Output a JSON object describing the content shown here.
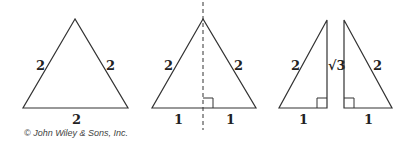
{
  "diagram": {
    "colors": {
      "stroke": "#333333",
      "text": "#222222",
      "background": "#ffffff"
    },
    "figures": [
      {
        "name": "equilateral-triangle",
        "labels": {
          "left_side": "2",
          "right_side": "2",
          "base": "2"
        }
      },
      {
        "name": "bisected-triangle",
        "labels": {
          "left_side": "2",
          "right_side": "2",
          "base_left": "1",
          "base_right": "1"
        },
        "has_dashed_altitude": true,
        "has_right_angle_marker": true
      },
      {
        "name": "left-right-triangle",
        "labels": {
          "hypotenuse": "2",
          "height": "√3",
          "base": "1"
        },
        "has_right_angle_marker": true
      },
      {
        "name": "right-right-triangle",
        "labels": {
          "hypotenuse": "2",
          "base": "1"
        },
        "has_right_angle_marker": true
      }
    ],
    "copyright": "© John Wiley & Sons, Inc."
  }
}
